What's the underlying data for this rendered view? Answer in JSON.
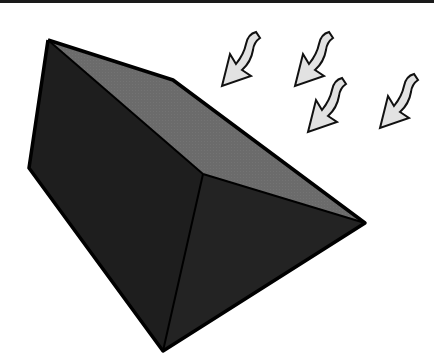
{
  "figure": {
    "colors": {
      "background": "#ffffff",
      "top_rule": "#1a1a1a",
      "front_face": "#1e1e1e",
      "right_face": "#222222",
      "top_face": "#6b6b6b",
      "edge": "#000000",
      "arrow_fill": "#e2e2e2",
      "arrow_stroke": "#111111"
    },
    "prism": {
      "vertices": {
        "top_left": [
          48,
          40
        ],
        "left": [
          29,
          168
        ],
        "bottom": [
          163,
          351
        ],
        "right": [
          365,
          223
        ],
        "ridge": [
          203,
          174
        ],
        "top_bend": [
          173,
          80
        ]
      }
    },
    "arrows": [
      {
        "name": "light-ray-1",
        "tip": [
          222,
          86
        ]
      },
      {
        "name": "light-ray-2",
        "tip": [
          295,
          86
        ]
      },
      {
        "name": "light-ray-3",
        "tip": [
          308,
          132
        ]
      },
      {
        "name": "light-ray-4",
        "tip": [
          380,
          128
        ]
      }
    ]
  }
}
